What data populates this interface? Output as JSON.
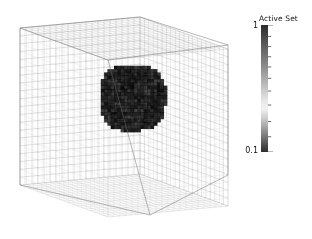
{
  "figure": {
    "background_color": "#ffffff",
    "width": 312,
    "height": 239,
    "type": "3d-amr-mesh-volume-rendering"
  },
  "colorbar": {
    "title": "Active Set",
    "max_label": "1",
    "min_label": "0.1",
    "scale": "log",
    "orientation": "vertical",
    "x": 261,
    "y": 25,
    "width": 7,
    "height": 127,
    "gradient_stops": [
      {
        "pos": 0,
        "color": "#2b2b2b"
      },
      {
        "pos": 10,
        "color": "#4a4a4a"
      },
      {
        "pos": 22,
        "color": "#6e6e6e"
      },
      {
        "pos": 35,
        "color": "#949494"
      },
      {
        "pos": 48,
        "color": "#bfbfbf"
      },
      {
        "pos": 60,
        "color": "#e8e8e8"
      },
      {
        "pos": 66,
        "color": "#f2f2f2"
      },
      {
        "pos": 74,
        "color": "#c9c9c9"
      },
      {
        "pos": 82,
        "color": "#9a9a9a"
      },
      {
        "pos": 90,
        "color": "#6a6a6a"
      },
      {
        "pos": 96,
        "color": "#454545"
      },
      {
        "pos": 100,
        "color": "#2e2e2e"
      }
    ],
    "minor_ticks": [
      0,
      9,
      17,
      25,
      33,
      42,
      52,
      63,
      76,
      88,
      100
    ]
  },
  "chart_data": {
    "type": "heatmap",
    "title": "Active Set",
    "xlabel": "",
    "ylabel": "",
    "colorbar_label": "Active Set",
    "colorbar_range": [
      0.1,
      1
    ],
    "colorbar_scale": "log",
    "legend_position": "right",
    "grid": true,
    "mesh": {
      "divisions_u": 20,
      "divisions_v": 20,
      "divisions_w": 20,
      "line_color": "#8c8c8c",
      "line_width": 0.35,
      "cube_vertices_2d": {
        "top_back": [
          140,
          17
        ],
        "top_left": [
          20,
          28
        ],
        "top_right": [
          228,
          45
        ],
        "top_front": [
          108,
          60
        ],
        "bottom_back": [
          140,
          145
        ],
        "bottom_left": [
          20,
          185
        ],
        "bottom_right": [
          228,
          175
        ],
        "bottom_front": [
          150,
          215
        ]
      }
    },
    "active_region": {
      "fill_color": "#111111",
      "center_2d": [
        131,
        96
      ],
      "extent_2d": [
        67,
        67
      ],
      "voxel_count_approx": 560,
      "shape": "blocky-sphere"
    }
  }
}
